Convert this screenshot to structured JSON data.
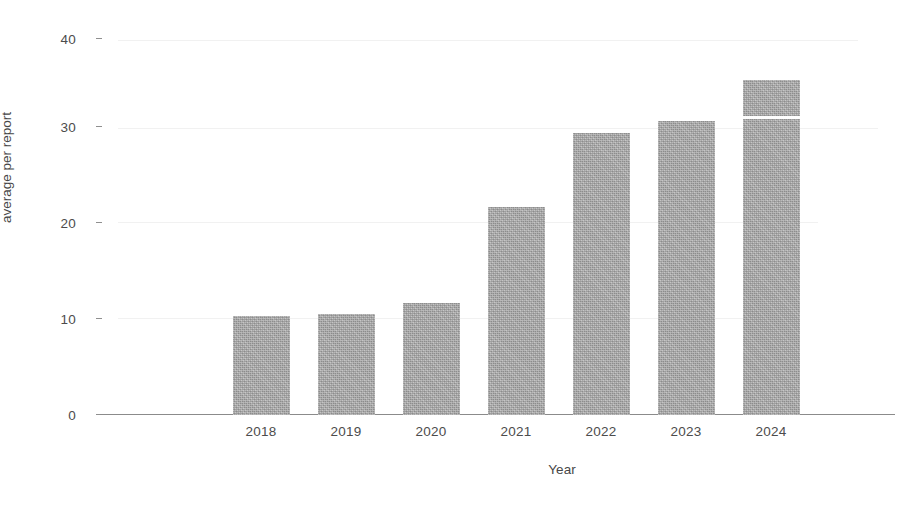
{
  "chart_data": {
    "type": "bar",
    "title": "",
    "subtitle": "",
    "xlabel": "Year",
    "ylabel": "average per report",
    "categories": [
      "2018",
      "2019",
      "2020",
      "2021",
      "2022",
      "2023",
      "2024"
    ],
    "values": [
      10.2,
      10.4,
      11.5,
      21.4,
      29.0,
      30.2,
      34.4
    ],
    "ylim": [
      0,
      40
    ],
    "yticks": [
      0,
      10,
      20,
      30,
      40
    ],
    "ytick_labels": [
      "0",
      "10",
      "20",
      "30",
      "40"
    ],
    "xlim_categories": 7,
    "grid": false,
    "legend": null,
    "legend_position": "none",
    "bar_color": "#a9a9a9",
    "axis_color": "#8b8b8b",
    "text_color": "#4a4a4a",
    "annotations": [
      {
        "kind": "segment-divider",
        "series_index": 6,
        "category": "2024",
        "value": 30.4,
        "note": "thin white horizontal line inside the 2024 bar"
      }
    ]
  },
  "axes": {
    "y_title": "average per report",
    "x_title": "Year"
  }
}
